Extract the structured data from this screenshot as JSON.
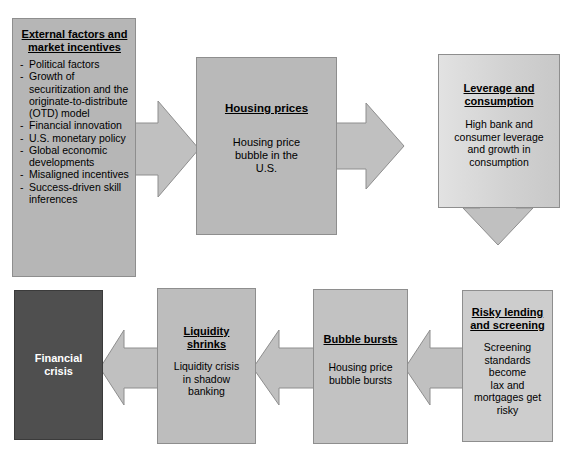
{
  "diagram": {
    "title_present": false,
    "colors": {
      "box_fill_gray": "#b6b6b6",
      "box_fill_light": "#d2d2d2",
      "box_fill_dark": "#4f4f4f",
      "arrow_fill": "#c0c0c0",
      "border": "#8e8e8e",
      "text_dark": "#000000",
      "text_light": "#ffffff"
    },
    "nodes": {
      "external": {
        "title": "External factors and\nmarket incentives",
        "bullets": [
          "Political factors",
          "Growth of securitization and the originate-to-distribute (OTD) model",
          "Financial innovation",
          "U.S. monetary policy",
          "Global economic developments",
          "Misaligned incentives",
          "Success-driven skill inferences"
        ],
        "bullet_marker": "-"
      },
      "housing": {
        "title": "Housing prices",
        "body": "Housing price\nbubble in the\nU.S."
      },
      "leverage": {
        "title": "Leverage and\nconsumption",
        "body": "High bank and\nconsumer leverage\nand growth in\nconsumption"
      },
      "risky": {
        "title": "Risky lending\nand screening",
        "body": "Screening\nstandards\nbecome\nlax and\nmortgages get\nrisky"
      },
      "bubble": {
        "title": "Bubble bursts",
        "body": "Housing price\nbubble bursts"
      },
      "liquidity": {
        "title": "Liquidity\nshrinks",
        "body": "Liquidity crisis\nin shadow\nbanking"
      },
      "crisis": {
        "title": "",
        "body": "Financial\ncrisis"
      }
    },
    "arrows": [
      {
        "name": "external-to-housing",
        "direction": "right"
      },
      {
        "name": "housing-to-leverage",
        "direction": "right"
      },
      {
        "name": "leverage-to-risky",
        "direction": "down"
      },
      {
        "name": "risky-to-bubble",
        "direction": "left"
      },
      {
        "name": "bubble-to-liquidity",
        "direction": "left"
      },
      {
        "name": "liquidity-to-crisis",
        "direction": "left"
      }
    ]
  }
}
